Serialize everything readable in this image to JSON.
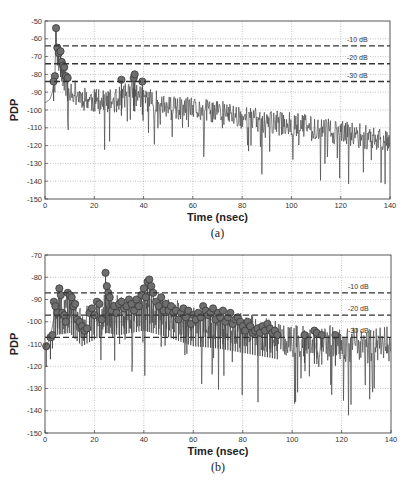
{
  "chart_data": [
    {
      "type": "line",
      "panel": "(a)",
      "title": "",
      "xlabel": "Time (nsec)",
      "ylabel": "PDP",
      "xlim": [
        0,
        140
      ],
      "ylim": [
        -150,
        -50
      ],
      "xticks": [
        0,
        20,
        40,
        60,
        80,
        100,
        120,
        140
      ],
      "yticks": [
        -50,
        -60,
        -70,
        -80,
        -90,
        -100,
        -110,
        -120,
        -130,
        -140,
        -150
      ],
      "grid": true,
      "caption": "(a)",
      "thresholds": [
        {
          "label": "-10 dB",
          "value": -64
        },
        {
          "label": "-20 dB",
          "value": -74
        },
        {
          "label": "-30 dB",
          "value": -84
        }
      ],
      "trace_envelope": [
        [
          0,
          -96
        ],
        [
          2,
          -94
        ],
        [
          3,
          -90
        ],
        [
          4,
          -80
        ],
        [
          4.5,
          -54
        ],
        [
          5,
          -65
        ],
        [
          6,
          -70
        ],
        [
          7,
          -75
        ],
        [
          8,
          -80
        ],
        [
          10,
          -88
        ],
        [
          15,
          -93
        ],
        [
          20,
          -95
        ],
        [
          25,
          -96
        ],
        [
          30,
          -94
        ],
        [
          35,
          -90
        ],
        [
          40,
          -93
        ],
        [
          50,
          -99
        ],
        [
          60,
          -100
        ],
        [
          70,
          -101
        ],
        [
          80,
          -104
        ],
        [
          90,
          -107
        ],
        [
          100,
          -108
        ],
        [
          110,
          -110
        ],
        [
          120,
          -113
        ],
        [
          130,
          -115
        ],
        [
          140,
          -117
        ]
      ],
      "noise_amp": 7,
      "seed": 11,
      "markers": [
        {
          "x": 4.5,
          "y": -54
        },
        {
          "x": 5.0,
          "y": -65
        },
        {
          "x": 5.6,
          "y": -68
        },
        {
          "x": 6.3,
          "y": -67
        },
        {
          "x": 6.8,
          "y": -73
        },
        {
          "x": 7.3,
          "y": -75
        },
        {
          "x": 7.8,
          "y": -76
        },
        {
          "x": 4.0,
          "y": -81
        },
        {
          "x": 8.5,
          "y": -81
        },
        {
          "x": 9.2,
          "y": -82
        },
        {
          "x": 3.5,
          "y": -84
        },
        {
          "x": 31,
          "y": -83
        },
        {
          "x": 36,
          "y": -82
        },
        {
          "x": 36.4,
          "y": -80
        },
        {
          "x": 39.5,
          "y": -84
        }
      ]
    },
    {
      "type": "line",
      "panel": "(b)",
      "title": "",
      "xlabel": "Time (nsec)",
      "ylabel": "PDP",
      "xlim": [
        0,
        140
      ],
      "ylim": [
        -150,
        -70
      ],
      "xticks": [
        0,
        20,
        40,
        60,
        80,
        100,
        120,
        140
      ],
      "yticks": [
        -70,
        -80,
        -90,
        -100,
        -110,
        -120,
        -130,
        -140,
        -150
      ],
      "grid": true,
      "caption": "(b)",
      "thresholds": [
        {
          "label": "-10 dB",
          "value": -87
        },
        {
          "label": "-20 dB",
          "value": -97
        },
        {
          "label": "-30 dB",
          "value": -107
        }
      ],
      "trace_envelope": [
        [
          0,
          -111
        ],
        [
          2,
          -108
        ],
        [
          4,
          -96
        ],
        [
          10,
          -95
        ],
        [
          15,
          -101
        ],
        [
          20,
          -98
        ],
        [
          25,
          -95
        ],
        [
          30,
          -96
        ],
        [
          40,
          -94
        ],
        [
          50,
          -97
        ],
        [
          60,
          -101
        ],
        [
          70,
          -102
        ],
        [
          80,
          -104
        ],
        [
          90,
          -106
        ],
        [
          100,
          -108
        ],
        [
          110,
          -109
        ],
        [
          120,
          -110
        ],
        [
          130,
          -111
        ],
        [
          140,
          -110
        ]
      ],
      "noise_amp": 8,
      "seed": 29,
      "markers": [
        {
          "x": 0.5,
          "y": -111
        },
        {
          "x": 2.2,
          "y": -107
        },
        {
          "x": 3,
          "y": -106
        },
        {
          "x": 3.6,
          "y": -91
        },
        {
          "x": 4.2,
          "y": -93
        },
        {
          "x": 5,
          "y": -96
        },
        {
          "x": 5.8,
          "y": -85
        },
        {
          "x": 6.4,
          "y": -88
        },
        {
          "x": 7,
          "y": -96
        },
        {
          "x": 7.8,
          "y": -97
        },
        {
          "x": 8.4,
          "y": -100
        },
        {
          "x": 9.2,
          "y": -87
        },
        {
          "x": 10,
          "y": -88
        },
        {
          "x": 10.8,
          "y": -89
        },
        {
          "x": 11.5,
          "y": -93
        },
        {
          "x": 12.2,
          "y": -92
        },
        {
          "x": 13,
          "y": -99
        },
        {
          "x": 14,
          "y": -100
        },
        {
          "x": 15,
          "y": -102
        },
        {
          "x": 16,
          "y": -104
        },
        {
          "x": 17,
          "y": -103
        },
        {
          "x": 18,
          "y": -96
        },
        {
          "x": 19,
          "y": -94
        },
        {
          "x": 20,
          "y": -97
        },
        {
          "x": 21,
          "y": -91
        },
        {
          "x": 22,
          "y": -92
        },
        {
          "x": 23,
          "y": -99
        },
        {
          "x": 24.5,
          "y": -78
        },
        {
          "x": 25,
          "y": -84
        },
        {
          "x": 25.6,
          "y": -87
        },
        {
          "x": 26.2,
          "y": -89
        },
        {
          "x": 27,
          "y": -95
        },
        {
          "x": 28,
          "y": -93
        },
        {
          "x": 29,
          "y": -96
        },
        {
          "x": 30,
          "y": -92
        },
        {
          "x": 31,
          "y": -91
        },
        {
          "x": 32,
          "y": -94
        },
        {
          "x": 33,
          "y": -93
        },
        {
          "x": 34,
          "y": -90
        },
        {
          "x": 35,
          "y": -92
        },
        {
          "x": 36,
          "y": -95
        },
        {
          "x": 37,
          "y": -90
        },
        {
          "x": 38,
          "y": -93
        },
        {
          "x": 39,
          "y": -88
        },
        {
          "x": 40,
          "y": -85
        },
        {
          "x": 40.8,
          "y": -89
        },
        {
          "x": 41.5,
          "y": -82
        },
        {
          "x": 42.2,
          "y": -81
        },
        {
          "x": 43,
          "y": -84
        },
        {
          "x": 43.8,
          "y": -87
        },
        {
          "x": 45,
          "y": -91
        },
        {
          "x": 46,
          "y": -93
        },
        {
          "x": 47,
          "y": -89
        },
        {
          "x": 48,
          "y": -95
        },
        {
          "x": 49,
          "y": -92
        },
        {
          "x": 50,
          "y": -95
        },
        {
          "x": 51,
          "y": -93
        },
        {
          "x": 52,
          "y": -96
        },
        {
          "x": 53,
          "y": -95
        },
        {
          "x": 54,
          "y": -99
        },
        {
          "x": 55,
          "y": -96
        },
        {
          "x": 56,
          "y": -94
        },
        {
          "x": 57,
          "y": -98
        },
        {
          "x": 58,
          "y": -95
        },
        {
          "x": 59,
          "y": -101
        },
        {
          "x": 60,
          "y": -97
        },
        {
          "x": 61,
          "y": -99
        },
        {
          "x": 62,
          "y": -96
        },
        {
          "x": 63,
          "y": -98
        },
        {
          "x": 64,
          "y": -93
        },
        {
          "x": 65,
          "y": -95
        },
        {
          "x": 66,
          "y": -97
        },
        {
          "x": 67,
          "y": -96
        },
        {
          "x": 68,
          "y": -94
        },
        {
          "x": 69,
          "y": -99
        },
        {
          "x": 70,
          "y": -96
        },
        {
          "x": 71,
          "y": -98
        },
        {
          "x": 72,
          "y": -95
        },
        {
          "x": 73,
          "y": -100
        },
        {
          "x": 74,
          "y": -98
        },
        {
          "x": 75,
          "y": -96
        },
        {
          "x": 76,
          "y": -101
        },
        {
          "x": 77,
          "y": -99
        },
        {
          "x": 78,
          "y": -98
        },
        {
          "x": 79,
          "y": -100
        },
        {
          "x": 80,
          "y": -102
        },
        {
          "x": 81,
          "y": -104
        },
        {
          "x": 82,
          "y": -100
        },
        {
          "x": 83,
          "y": -102
        },
        {
          "x": 84,
          "y": -105
        },
        {
          "x": 85,
          "y": -104
        },
        {
          "x": 86,
          "y": -103
        },
        {
          "x": 87,
          "y": -105
        },
        {
          "x": 88,
          "y": -102
        },
        {
          "x": 89,
          "y": -104
        },
        {
          "x": 90,
          "y": -101
        },
        {
          "x": 91,
          "y": -103
        },
        {
          "x": 92,
          "y": -105
        },
        {
          "x": 93,
          "y": -104
        },
        {
          "x": 94,
          "y": -106
        },
        {
          "x": 105,
          "y": -106
        },
        {
          "x": 109,
          "y": -104
        },
        {
          "x": 110,
          "y": -105
        },
        {
          "x": 112,
          "y": -106
        },
        {
          "x": 117.5,
          "y": -106
        }
      ]
    }
  ],
  "labels": {
    "ylabel_a": "PDP",
    "xlabel_a": "Time (nsec)",
    "caption_a": "(a)",
    "ylabel_b": "PDP",
    "xlabel_b": "Time (nsec)",
    "caption_b": "(b)"
  },
  "colors": {
    "trace": "#4a4a4a",
    "marker_fill": "#6e6e6e",
    "marker_stroke": "#3a3a3a",
    "threshold": "#333333",
    "grid": "#9a9a9a",
    "axis": "#444444"
  }
}
